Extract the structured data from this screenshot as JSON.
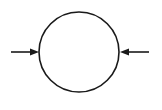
{
  "diagram": {
    "stroke_color": "#1a1a1a",
    "background": "#ffffff",
    "circle": {
      "cx": 79,
      "cy": 52,
      "r": 40
    },
    "arrows": [
      {
        "name": "left-arrow",
        "x1": 11,
        "y1": 52,
        "x2": 39,
        "y2": 52
      },
      {
        "name": "right-arrow",
        "x1": 149,
        "y1": 52,
        "x2": 120,
        "y2": 52
      }
    ]
  }
}
